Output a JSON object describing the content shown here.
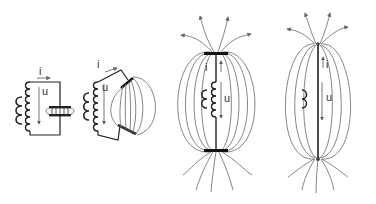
{
  "diagram": {
    "colors": {
      "wire": "#1a1a1a",
      "field_line": "#777777",
      "label": "#333333",
      "arrow": "#666666"
    },
    "panels": [
      {
        "id": "closed-lc-circuit",
        "current_label": "i",
        "voltage_label": "u",
        "components": [
          "inductor-coil",
          "excitation-coil",
          "capacitor"
        ]
      },
      {
        "id": "opening-capacitor",
        "current_label": "i",
        "voltage_label": "u",
        "components": [
          "inductor-coil",
          "excitation-coil",
          "tilted-capacitor",
          "field-lines"
        ]
      },
      {
        "id": "open-circuit-with-coil",
        "current_label": "i",
        "voltage_label": "u",
        "components": [
          "inductor-coil",
          "excitation-coil",
          "end-plates",
          "field-lines",
          "radiating-arrows"
        ]
      },
      {
        "id": "dipole-antenna",
        "current_label": "i",
        "voltage_label": "u",
        "components": [
          "straight-wire",
          "excitation-coil",
          "field-lines",
          "radiating-arrows"
        ]
      }
    ]
  }
}
